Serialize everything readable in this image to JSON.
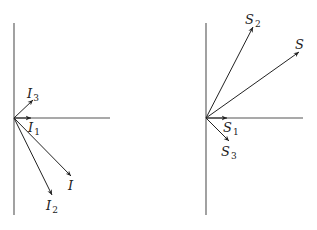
{
  "diagrams": [
    {
      "name": "current-phasors",
      "origin": [
        14,
        118
      ],
      "vertical_axis": {
        "x": 14,
        "y1": 23,
        "y2": 215
      },
      "horizontal_axis": {
        "y": 118,
        "x1": 14,
        "x2": 110
      },
      "vectors": [
        {
          "id": "I1",
          "symbol": "I",
          "subscript": "1",
          "tip": [
            31,
            118
          ],
          "label_pos": [
            28,
            132
          ]
        },
        {
          "id": "I3",
          "symbol": "I",
          "subscript": "3",
          "tip": [
            33,
            100
          ],
          "label_pos": [
            27,
            98
          ]
        },
        {
          "id": "I",
          "symbol": "I",
          "subscript": "",
          "tip": [
            71,
            176
          ],
          "label_pos": [
            68,
            190
          ]
        },
        {
          "id": "I2",
          "symbol": "I",
          "subscript": "2",
          "tip": [
            52,
            195
          ],
          "label_pos": [
            46,
            210
          ]
        }
      ]
    },
    {
      "name": "power-phasors",
      "origin": [
        206,
        118
      ],
      "vertical_axis": {
        "x": 206,
        "y1": 23,
        "y2": 215
      },
      "horizontal_axis": {
        "y": 118,
        "x1": 206,
        "x2": 303
      },
      "vectors": [
        {
          "id": "S1",
          "symbol": "S",
          "subscript": "1",
          "tip": [
            227,
            118
          ],
          "label_pos": [
            223,
            132
          ]
        },
        {
          "id": "S3",
          "symbol": "S",
          "subscript": "3",
          "tip": [
            229,
            141
          ],
          "label_pos": [
            221,
            156
          ]
        },
        {
          "id": "S2",
          "symbol": "S",
          "subscript": "2",
          "tip": [
            253,
            27
          ],
          "label_pos": [
            245,
            24
          ]
        },
        {
          "id": "S",
          "symbol": "S",
          "subscript": "",
          "tip": [
            299,
            52
          ],
          "label_pos": [
            295,
            49
          ]
        }
      ]
    }
  ],
  "colors": {
    "axis": "#555555",
    "vector": "#222222",
    "background": "#ffffff"
  }
}
